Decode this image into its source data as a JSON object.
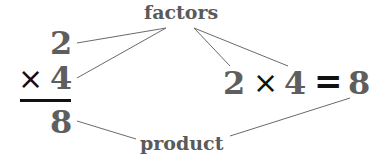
{
  "labels": {
    "factors": "factors",
    "product": "product"
  },
  "vertical": {
    "top_factor": "2",
    "operator": "×",
    "bottom_factor": "4",
    "result": "8"
  },
  "horizontal": {
    "factor_a": "2",
    "operator": "×",
    "factor_b": "4",
    "equals": "=",
    "result": "8"
  },
  "colors": {
    "number": "#5e5e5e",
    "label": "#5a5a5a",
    "operator": "#111111",
    "leader_line": "#6a6a6a"
  }
}
